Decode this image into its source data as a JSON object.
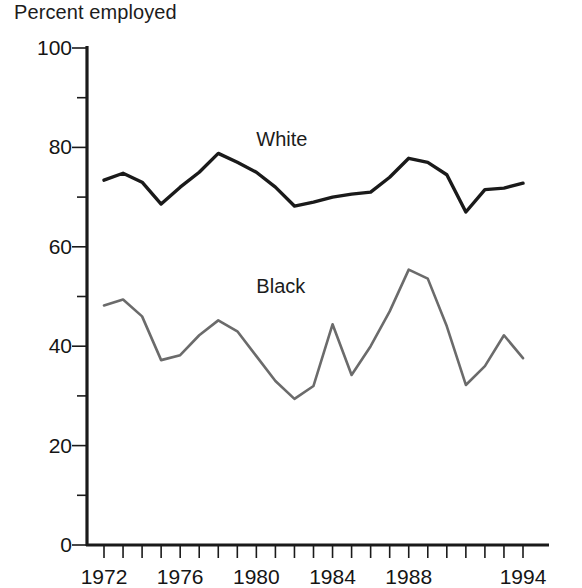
{
  "chart_data": {
    "type": "line",
    "title": "Percent employed",
    "ylabel": "Percent employed",
    "xlabel": "",
    "ylim": [
      0,
      100
    ],
    "xlim": [
      1972,
      1994
    ],
    "grid": false,
    "legend_position": "inline-annotation",
    "y_ticks": [
      0,
      20,
      40,
      60,
      80,
      100
    ],
    "y_tick_labels": [
      "0",
      "20",
      "40",
      "60",
      "80",
      "100"
    ],
    "y_minor_ticks": [
      10,
      30,
      50,
      70,
      90
    ],
    "x_ticks": [
      1972,
      1973,
      1974,
      1975,
      1976,
      1977,
      1978,
      1979,
      1980,
      1981,
      1982,
      1983,
      1984,
      1985,
      1986,
      1987,
      1988,
      1989,
      1990,
      1991,
      1992,
      1993,
      1994
    ],
    "x_tick_labels": [
      "1972",
      "1976",
      "1980",
      "1984",
      "1988",
      "1994"
    ],
    "x_labeled_ticks": [
      1972,
      1976,
      1980,
      1984,
      1988,
      1994
    ],
    "x": [
      1972,
      1973,
      1974,
      1975,
      1976,
      1977,
      1978,
      1979,
      1980,
      1981,
      1982,
      1983,
      1984,
      1985,
      1986,
      1987,
      1988,
      1989,
      1990,
      1991,
      1992,
      1993,
      1994
    ],
    "series": [
      {
        "name": "White",
        "color": "#1a1a1a",
        "stroke_width": 3.4,
        "label_x": 1980.0,
        "label_y": 81.5,
        "values": [
          73.4,
          74.8,
          73.0,
          68.6,
          72.0,
          75.0,
          78.8,
          77.0,
          75.0,
          72.0,
          68.2,
          69.0,
          70.0,
          70.6,
          71.0,
          74.0,
          77.8,
          77.0,
          74.5,
          67.0,
          71.5,
          71.8,
          72.8
        ]
      },
      {
        "name": "Black",
        "color": "#6b6b6b",
        "stroke_width": 2.6,
        "label_x": 1980.0,
        "label_y": 52.0,
        "values": [
          48.2,
          49.4,
          46.0,
          37.2,
          38.2,
          42.2,
          45.2,
          43.0,
          38.0,
          33.0,
          29.4,
          32.0,
          44.4,
          34.2,
          40.0,
          47.0,
          55.4,
          53.6,
          44.0,
          32.2,
          36.0,
          42.2,
          37.6
        ]
      }
    ],
    "annotations": [
      {
        "text": "White",
        "x": 1980.0,
        "y": 81.5
      },
      {
        "text": "Black",
        "x": 1980.0,
        "y": 52.0
      }
    ]
  }
}
